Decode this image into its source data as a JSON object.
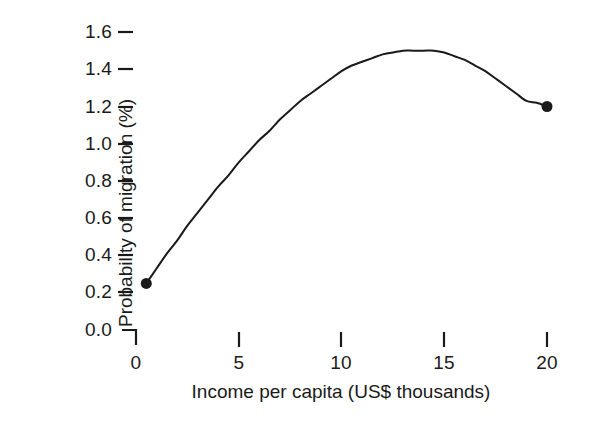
{
  "chart_data": {
    "type": "line",
    "title": "",
    "xlabel": "Income per capita (US$ thousands)",
    "ylabel": "Probability of migration (%)",
    "xlim": [
      0,
      21
    ],
    "ylim": [
      0.0,
      1.7
    ],
    "xticks": [
      0,
      5,
      10,
      15,
      20
    ],
    "xtick_labels": [
      "0",
      "5",
      "10",
      "15",
      "20"
    ],
    "yticks": [
      0.0,
      0.2,
      0.4,
      0.6,
      0.8,
      1.0,
      1.2,
      1.4,
      1.6
    ],
    "ytick_labels": [
      "0.0",
      "0.2",
      "0.4",
      "0.6",
      "0.8",
      "1.0",
      "1.2",
      "1.4",
      "1.6"
    ],
    "grid": false,
    "legend": null,
    "line_color": "#1a1a1a",
    "marker_color": "#1a1a1a",
    "series": [
      {
        "name": "Probability of migration",
        "x": [
          0.5,
          1.0,
          1.5,
          2.0,
          2.5,
          3.0,
          3.5,
          4.0,
          4.5,
          5.0,
          5.5,
          6.0,
          6.5,
          7.0,
          7.5,
          8.0,
          8.5,
          9.0,
          9.5,
          10.0,
          10.5,
          11.0,
          11.5,
          12.0,
          12.5,
          13.0,
          13.5,
          14.0,
          14.5,
          15.0,
          15.5,
          16.0,
          16.5,
          17.0,
          17.5,
          18.0,
          18.5,
          19.0,
          19.5,
          20.0
        ],
        "y": [
          0.25,
          0.33,
          0.41,
          0.48,
          0.56,
          0.63,
          0.7,
          0.77,
          0.83,
          0.9,
          0.96,
          1.02,
          1.07,
          1.13,
          1.18,
          1.23,
          1.27,
          1.31,
          1.35,
          1.39,
          1.42,
          1.44,
          1.46,
          1.48,
          1.49,
          1.5,
          1.5,
          1.5,
          1.5,
          1.49,
          1.47,
          1.45,
          1.42,
          1.39,
          1.35,
          1.31,
          1.27,
          1.23,
          1.22,
          1.2
        ]
      }
    ],
    "markers": [
      {
        "label": "start-point",
        "x": 0.5,
        "y": 0.25
      },
      {
        "label": "end-point",
        "x": 20.0,
        "y": 1.2
      }
    ],
    "peak": {
      "x": 14.0,
      "y": 1.5
    }
  },
  "axes": {
    "y_title": "Probability of migration (%)",
    "x_title": "Income per capita (US$ thousands)",
    "y_tick_labels": [
      "1.6",
      "1.4",
      "1.2",
      "1.0",
      "0.8",
      "0.6",
      "0.4",
      "0.2",
      "0.0"
    ],
    "x_tick_labels": [
      "0",
      "5",
      "10",
      "15",
      "20"
    ]
  }
}
